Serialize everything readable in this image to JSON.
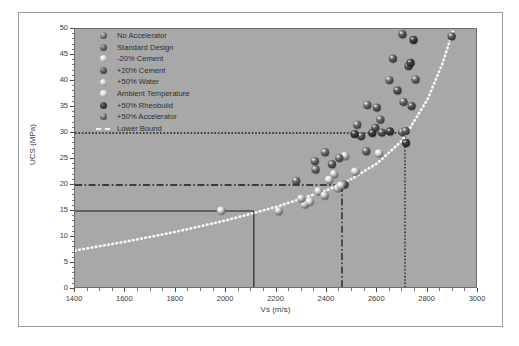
{
  "chart_data": {
    "type": "scatter",
    "title": "",
    "xlabel": "Vs (m/s)",
    "ylabel": "UCS (MPa)",
    "xlim": [
      1400,
      3000
    ],
    "ylim": [
      0,
      50
    ],
    "xticks": [
      1400,
      1600,
      1800,
      2000,
      2200,
      2400,
      2600,
      2800,
      3000
    ],
    "yticks": [
      0,
      5,
      10,
      15,
      20,
      25,
      30,
      35,
      40,
      45,
      50
    ],
    "x_minor_step": 50,
    "y_minor_step": 1,
    "grid": false,
    "plot_background": "#a8a8a8",
    "figure_background": "#ffffff",
    "legend_position": "upper left",
    "series": [
      {
        "name": "No Accelerator",
        "color": "#6f6f6f",
        "points": [
          [
            2278,
            20.8
          ],
          [
            2355,
            23.0
          ],
          [
            2392,
            26.3
          ],
          [
            2520,
            31.6
          ],
          [
            2560,
            35.4
          ],
          [
            2648,
            40.2
          ],
          [
            2700,
            30.2
          ]
        ]
      },
      {
        "name": "Standard Design",
        "color": "#5e5e5e",
        "points": [
          [
            2420,
            24.0
          ],
          [
            2470,
            20.1
          ],
          [
            2598,
            34.9
          ],
          [
            2662,
            44.3
          ],
          [
            2700,
            49.0
          ],
          [
            2712,
            30.4
          ],
          [
            2895,
            48.6
          ]
        ]
      },
      {
        "name": "-20% Cement",
        "color": "#cfcfcf",
        "points": [
          [
            2312,
            16.3
          ],
          [
            2366,
            18.8
          ],
          [
            2443,
            19.4
          ],
          [
            2455,
            19.9
          ],
          [
            2512,
            22.6
          ]
        ]
      },
      {
        "name": "+20% Cement",
        "color": "#555555",
        "points": [
          [
            2536,
            29.4
          ],
          [
            2592,
            31.0
          ],
          [
            2618,
            30.1
          ],
          [
            2680,
            38.2
          ],
          [
            2724,
            42.9
          ],
          [
            2736,
            35.2
          ]
        ]
      },
      {
        "name": "+50% Water",
        "color": "#c4c4c4",
        "points": [
          [
            2208,
            15.0
          ],
          [
            2298,
            17.4
          ],
          [
            2390,
            18.0
          ],
          [
            2428,
            22.1
          ],
          [
            2472,
            25.6
          ]
        ]
      },
      {
        "name": "Ambient Temperature",
        "color": "#d8d8d8",
        "points": [
          [
            1980,
            15.1
          ],
          [
            2331,
            16.8
          ],
          [
            2408,
            21.0
          ],
          [
            2606,
            26.1
          ]
        ]
      },
      {
        "name": "+50% Rheobuild",
        "color": "#3d3d3d",
        "points": [
          [
            2510,
            29.8
          ],
          [
            2580,
            30.0
          ],
          [
            2650,
            30.3
          ],
          [
            2714,
            28.1
          ],
          [
            2732,
            43.5
          ],
          [
            2744,
            47.9
          ]
        ]
      },
      {
        "name": "+50% Accelerator",
        "color": "#6a6a6a",
        "points": [
          [
            2352,
            24.6
          ],
          [
            2449,
            25.2
          ],
          [
            2556,
            26.5
          ],
          [
            2612,
            32.6
          ],
          [
            2704,
            36.0
          ],
          [
            2752,
            40.3
          ]
        ]
      }
    ],
    "lower_bound": {
      "name": "Lower Bound",
      "style": "dotted",
      "color": "#fbfbfb",
      "points": [
        [
          1400,
          7.4
        ],
        [
          1600,
          9.1
        ],
        [
          1800,
          11.0
        ],
        [
          2000,
          13.2
        ],
        [
          2200,
          15.8
        ],
        [
          2400,
          19.0
        ],
        [
          2500,
          21.2
        ],
        [
          2600,
          24.2
        ],
        [
          2700,
          28.6
        ],
        [
          2800,
          36.5
        ],
        [
          2860,
          43.5
        ],
        [
          2900,
          49.5
        ]
      ]
    },
    "reference_lines": [
      {
        "name": "solid-threshold",
        "style": "solid",
        "color": "#1a1a1a",
        "ucs": 15,
        "vs": 2110
      },
      {
        "name": "dashdot-threshold",
        "style": "dashdot",
        "color": "#1a1a1a",
        "ucs": 20,
        "vs": 2460
      },
      {
        "name": "dotted-threshold",
        "style": "dotted",
        "color": "#1a1a1a",
        "ucs": 30,
        "vs": 2710
      }
    ]
  },
  "axes": {
    "x_title": "Vs (m/s)",
    "y_title": "UCS (MPa)",
    "x_tick_labels": [
      "1400",
      "1600",
      "1800",
      "2000",
      "2200",
      "2400",
      "2600",
      "2800",
      "3000"
    ],
    "y_tick_labels": [
      "0",
      "5",
      "10",
      "15",
      "20",
      "25",
      "30",
      "35",
      "40",
      "45",
      "50"
    ]
  },
  "legend": {
    "items": [
      {
        "label": "No Accelerator",
        "marker": "sphere",
        "color": "#6f6f6f"
      },
      {
        "label": "Standard Design",
        "marker": "sphere",
        "color": "#5e5e5e"
      },
      {
        "label": "-20% Cement",
        "marker": "sphere",
        "color": "#cfcfcf"
      },
      {
        "label": "+20% Cement",
        "marker": "sphere",
        "color": "#555555"
      },
      {
        "label": "+50% Water",
        "marker": "sphere",
        "color": "#c4c4c4"
      },
      {
        "label": "Ambient Temperature",
        "marker": "sphere",
        "color": "#d8d8d8"
      },
      {
        "label": "+50% Rheobuild",
        "marker": "sphere",
        "color": "#3d3d3d"
      },
      {
        "label": "+50% Accelerator",
        "marker": "sphere",
        "color": "#6a6a6a"
      },
      {
        "label": "Lower Bound",
        "marker": "dashed-line",
        "color": "#f2f2f2"
      }
    ]
  }
}
